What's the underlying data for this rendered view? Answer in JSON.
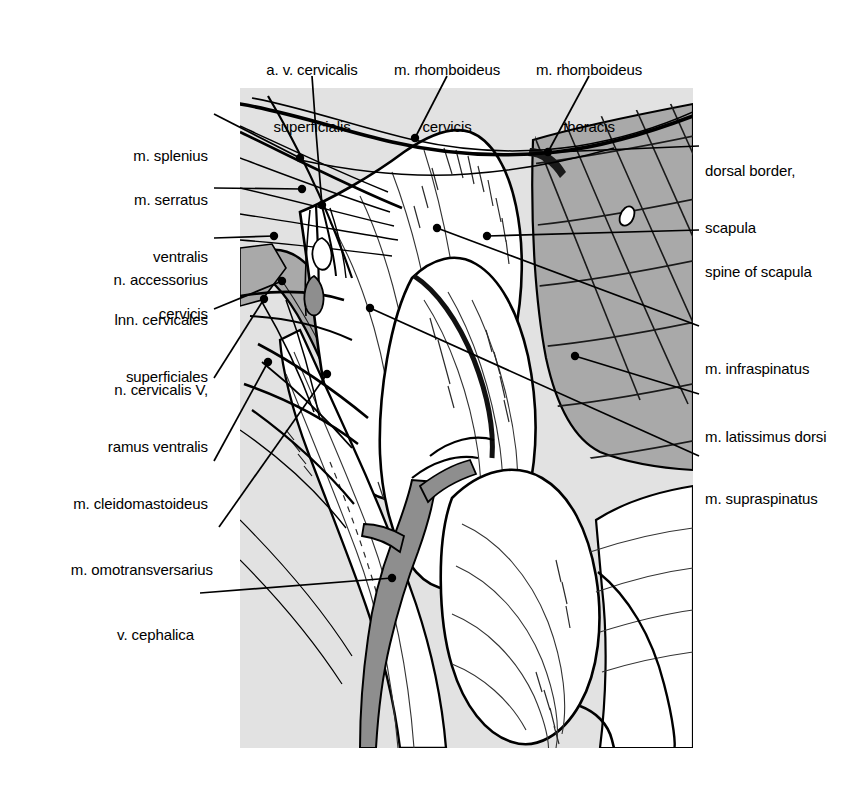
{
  "figure": {
    "kind": "anatomical-illustration",
    "colors": {
      "background": "#ffffff",
      "panel_gray": "#e2e2e2",
      "muscle_shade_gray": "#a9a9a9",
      "vessel_gray": "#8e8e8e",
      "ink": "#000000"
    },
    "panel": {
      "x": 240,
      "y": 88,
      "width": 453,
      "height": 660
    }
  },
  "labels": {
    "top": [
      {
        "id": "a-v-cervicalis-superficialis",
        "lines": [
          "a. v. cervicalis",
          "superficialis"
        ],
        "text_x": 312,
        "text_y": 30,
        "align": "center",
        "leader": [
          [
            312,
            76
          ],
          [
            316,
            132
          ],
          [
            322,
            205
          ]
        ]
      },
      {
        "id": "m-rhomboideus-cervicis",
        "lines": [
          "m. rhomboideus",
          "cervicis"
        ],
        "text_x": 447,
        "text_y": 30,
        "align": "center",
        "leader": [
          [
            447,
            76
          ],
          [
            415,
            138
          ]
        ]
      },
      {
        "id": "m-rhomboideus-thoracis",
        "lines": [
          "m. rhomboideus",
          "thoracis"
        ],
        "text_x": 589,
        "text_y": 30,
        "align": "center",
        "leader": [
          [
            589,
            76
          ],
          [
            548,
            152
          ]
        ]
      }
    ],
    "left": [
      {
        "id": "m-splenius",
        "lines": [
          "m. splenius"
        ],
        "text_x": 208,
        "text_y": 118,
        "align": "right",
        "leader": [
          [
            214,
            114
          ],
          [
            300,
            158
          ]
        ]
      },
      {
        "id": "m-serratus-ventralis-cervicis",
        "lines": [
          "m. serratus",
          "ventralis",
          "cervicis"
        ],
        "text_x": 208,
        "text_y": 160,
        "align": "right",
        "leader": [
          [
            214,
            188
          ],
          [
            302,
            189
          ]
        ]
      },
      {
        "id": "n-accessorius",
        "lines": [
          "n. accessorius"
        ],
        "text_x": 208,
        "text_y": 241,
        "align": "right",
        "leader": [
          [
            214,
            238
          ],
          [
            274,
            236
          ]
        ]
      },
      {
        "id": "lnn-cervicales-superficiales",
        "lines": [
          "lnn. cervicales",
          "superficiales"
        ],
        "text_x": 208,
        "text_y": 281,
        "align": "right",
        "leader": [
          [
            214,
            309
          ],
          [
            282,
            281
          ]
        ]
      },
      {
        "id": "n-cervicalis-v-ramus-ventralis",
        "lines": [
          "n. cervicalis V,",
          "ramus ventralis"
        ],
        "text_x": 208,
        "text_y": 351,
        "align": "right",
        "leader": [
          [
            214,
            378
          ],
          [
            264,
            299
          ]
        ]
      },
      {
        "id": "m-cleidomastoideus",
        "lines": [
          "m. cleidomastoideus"
        ],
        "text_x": 208,
        "text_y": 465,
        "align": "right",
        "leader": [
          [
            214,
            461
          ],
          [
            268,
            362
          ]
        ]
      },
      {
        "id": "m-omotransversarius",
        "lines": [
          "m. omotransversarius"
        ],
        "text_x": 213,
        "text_y": 531,
        "align": "right",
        "leader": [
          [
            219,
            527
          ],
          [
            327,
            374
          ]
        ]
      },
      {
        "id": "v-cephalica",
        "lines": [
          "v. cephalica"
        ],
        "text_x": 194,
        "text_y": 596,
        "align": "right",
        "leader": [
          [
            200,
            593
          ],
          [
            392,
            578
          ]
        ]
      }
    ],
    "right": [
      {
        "id": "dorsal-border-scapula",
        "lines": [
          "dorsal border,",
          "scapula"
        ],
        "text_x": 705,
        "text_y": 131,
        "align": "left",
        "leader": [
          [
            699,
            146
          ],
          [
            555,
            152
          ]
        ]
      },
      {
        "id": "spine-of-scapula",
        "lines": [
          "spine of scapula"
        ],
        "text_x": 705,
        "text_y": 233,
        "align": "left",
        "leader": [
          [
            699,
            230
          ],
          [
            487,
            236
          ]
        ]
      },
      {
        "id": "m-infraspinatus",
        "lines": [
          "m. infraspinatus"
        ],
        "text_x": 705,
        "text_y": 330,
        "align": "left",
        "leader": [
          [
            699,
            326
          ],
          [
            437,
            228
          ]
        ]
      },
      {
        "id": "m-latissimus-dorsi",
        "lines": [
          "m. latissimus dorsi"
        ],
        "text_x": 705,
        "text_y": 398,
        "align": "left",
        "leader": [
          [
            699,
            394
          ],
          [
            575,
            356
          ]
        ]
      },
      {
        "id": "m-supraspinatus",
        "lines": [
          "m. supraspinatus"
        ],
        "text_x": 705,
        "text_y": 460,
        "align": "left",
        "leader": [
          [
            699,
            456
          ],
          [
            370,
            308
          ]
        ]
      }
    ]
  }
}
